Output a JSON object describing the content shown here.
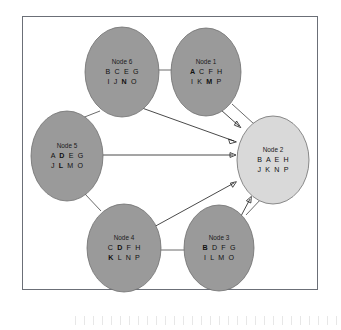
{
  "figure": {
    "type": "node-graph-diagram",
    "frame": {
      "border_color": "#6b6f77",
      "background": "#ffffff"
    },
    "colors": {
      "node_fill_default": "#9a9a9a",
      "node_fill_highlight": "#d9d9d9",
      "node_stroke": "#6e6e6e",
      "edge_color": "#3a3a3a",
      "arrow_color": "#1c1c1c",
      "text_color": "#111111"
    }
  },
  "nodes": [
    {
      "id": "node-1",
      "title": "Node 1",
      "rows": [
        [
          {
            "t": "A",
            "bold": true
          },
          {
            "t": "C",
            "bold": false
          },
          {
            "t": "F",
            "bold": false
          },
          {
            "t": "H",
            "bold": false
          }
        ],
        [
          {
            "t": "I",
            "bold": false
          },
          {
            "t": "K",
            "bold": false
          },
          {
            "t": "M",
            "bold": true
          },
          {
            "t": "P",
            "bold": false
          }
        ]
      ],
      "highlight": false,
      "cx": 206,
      "cy": 72,
      "rx": 35,
      "ry": 44
    },
    {
      "id": "node-2",
      "title": "Node 2",
      "rows": [
        [
          {
            "t": "B",
            "bold": false
          },
          {
            "t": "A",
            "bold": false
          },
          {
            "t": "E",
            "bold": false
          },
          {
            "t": "H",
            "bold": false
          }
        ],
        [
          {
            "t": "J",
            "bold": false
          },
          {
            "t": "K",
            "bold": false
          },
          {
            "t": "N",
            "bold": false
          },
          {
            "t": "P",
            "bold": false
          }
        ]
      ],
      "highlight": true,
      "cx": 273,
      "cy": 160,
      "rx": 36,
      "ry": 44
    },
    {
      "id": "node-3",
      "title": "Node 3",
      "rows": [
        [
          {
            "t": "B",
            "bold": true
          },
          {
            "t": "D",
            "bold": false
          },
          {
            "t": "F",
            "bold": false
          },
          {
            "t": "G",
            "bold": false
          }
        ],
        [
          {
            "t": "I",
            "bold": false
          },
          {
            "t": "L",
            "bold": false
          },
          {
            "t": "M",
            "bold": false
          },
          {
            "t": "O",
            "bold": false
          }
        ]
      ],
      "highlight": false,
      "cx": 219,
      "cy": 248,
      "rx": 35,
      "ry": 43
    },
    {
      "id": "node-4",
      "title": "Node 4",
      "rows": [
        [
          {
            "t": "C",
            "bold": false
          },
          {
            "t": "D",
            "bold": true
          },
          {
            "t": "F",
            "bold": false
          },
          {
            "t": "H",
            "bold": false
          }
        ],
        [
          {
            "t": "K",
            "bold": true
          },
          {
            "t": "L",
            "bold": false
          },
          {
            "t": "N",
            "bold": false
          },
          {
            "t": "P",
            "bold": false
          }
        ]
      ],
      "highlight": false,
      "cx": 124,
      "cy": 248,
      "rx": 37,
      "ry": 44
    },
    {
      "id": "node-5",
      "title": "Node 5",
      "rows": [
        [
          {
            "t": "A",
            "bold": false
          },
          {
            "t": "D",
            "bold": true
          },
          {
            "t": "E",
            "bold": false
          },
          {
            "t": "G",
            "bold": false
          }
        ],
        [
          {
            "t": "J",
            "bold": false
          },
          {
            "t": "L",
            "bold": true
          },
          {
            "t": "M",
            "bold": false
          },
          {
            "t": "O",
            "bold": false
          }
        ]
      ],
      "highlight": false,
      "cx": 67,
      "cy": 156,
      "rx": 36,
      "ry": 45
    },
    {
      "id": "node-6",
      "title": "Node 6",
      "rows": [
        [
          {
            "t": "B",
            "bold": false
          },
          {
            "t": "C",
            "bold": false
          },
          {
            "t": "E",
            "bold": false
          },
          {
            "t": "G",
            "bold": false
          }
        ],
        [
          {
            "t": "I",
            "bold": false
          },
          {
            "t": "J",
            "bold": false
          },
          {
            "t": "N",
            "bold": true
          },
          {
            "t": "O",
            "bold": false
          }
        ]
      ],
      "highlight": false,
      "cx": 122,
      "cy": 72,
      "rx": 37,
      "ry": 45
    }
  ],
  "edges": [
    {
      "id": "edge-6-1",
      "from": "node-6",
      "to": "node-1",
      "arrow": false
    },
    {
      "id": "edge-1-2",
      "from": "node-1",
      "to": "node-2",
      "arrow": false
    },
    {
      "id": "edge-6-5",
      "from": "node-6",
      "to": "node-5",
      "arrow": false
    },
    {
      "id": "edge-5-4",
      "from": "node-5",
      "to": "node-4",
      "arrow": false
    },
    {
      "id": "edge-4-3",
      "from": "node-4",
      "to": "node-3",
      "arrow": false
    },
    {
      "id": "edge-3-2",
      "from": "node-3",
      "to": "node-2",
      "arrow": false
    },
    {
      "id": "arrow-1-2",
      "from": "node-1",
      "to": "node-2",
      "arrow": true
    },
    {
      "id": "arrow-6-2",
      "from": "node-6",
      "to": "node-2",
      "arrow": true
    },
    {
      "id": "arrow-5-2",
      "from": "node-5",
      "to": "node-2",
      "arrow": true
    },
    {
      "id": "arrow-4-2",
      "from": "node-4",
      "to": "node-2",
      "arrow": true
    },
    {
      "id": "arrow-3-2",
      "from": "node-3",
      "to": "node-2",
      "arrow": true
    }
  ]
}
